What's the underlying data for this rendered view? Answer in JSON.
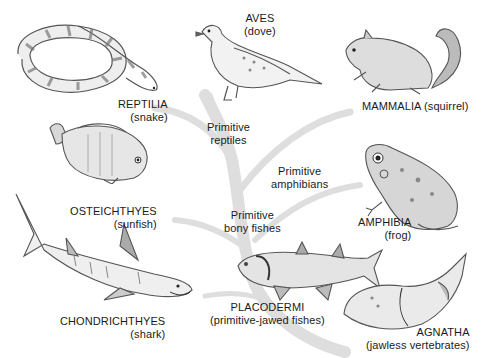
{
  "diagram": {
    "colors": {
      "branch": "#dcdcdc",
      "ink": "#1a1a1a",
      "sketch": "#555555",
      "shade": "#bdbdbd"
    },
    "classes": [
      {
        "id": "reptilia",
        "name": "REPTILIA",
        "example": "(snake)"
      },
      {
        "id": "aves",
        "name": "AVES",
        "example": "(dove)"
      },
      {
        "id": "mammalia",
        "name": "MAMMALIA",
        "example": "(squirrel)"
      },
      {
        "id": "osteichthyes",
        "name": "OSTEICHTHYES",
        "example": "(sunfish)"
      },
      {
        "id": "amphibia",
        "name": "AMPHIBIA",
        "example": "(frog)"
      },
      {
        "id": "chondrichthyes",
        "name": "CHONDRICHTHYES",
        "example": "(shark)"
      },
      {
        "id": "placodermi",
        "name": "PLACODERMI",
        "example": "(primitive-jawed fishes)"
      },
      {
        "id": "agnatha",
        "name": "AGNATHA",
        "example": "(jawless vertebrates)"
      }
    ],
    "branch_labels": [
      {
        "id": "primitive-reptiles",
        "line1": "Primitive",
        "line2": "reptiles"
      },
      {
        "id": "primitive-amphibians",
        "line1": "Primitive",
        "line2": "amphibians"
      },
      {
        "id": "primitive-bony-fishes",
        "line1": "Primitive",
        "line2": "bony fishes"
      }
    ]
  }
}
